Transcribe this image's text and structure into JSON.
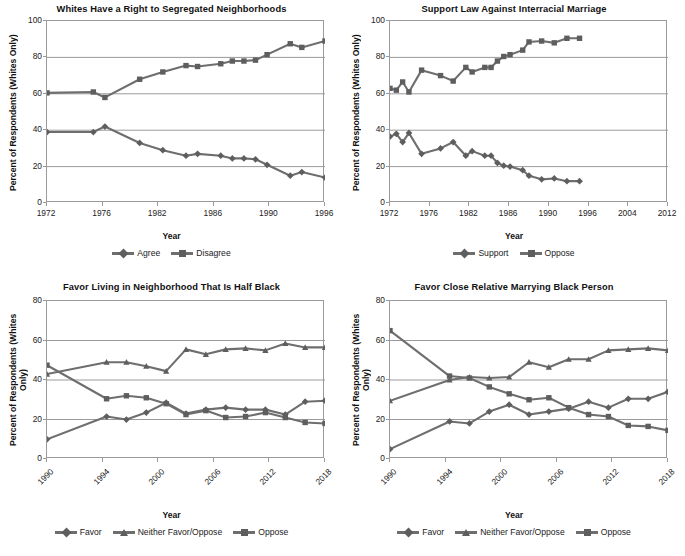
{
  "figure": {
    "background": "#ffffff",
    "series_color": "#6e6e6e",
    "marker_color": "#5e5e5e",
    "grid_color": "#9a9a9a",
    "axis_color": "#9a9a9a"
  },
  "panels": [
    {
      "key": "segregated-neighborhoods",
      "title": "Whites Have a Right to Segregated Neighborhoods",
      "ylabel": "Percent of Respondents (Whites Only)",
      "xlabel": "Year",
      "legend": [
        {
          "label": "Agree",
          "marker": "diamond"
        },
        {
          "label": "Disagree",
          "marker": "square"
        }
      ]
    },
    {
      "key": "interracial-marriage-law",
      "title": "Support Law Against Interracial Marriage",
      "ylabel": "Percent of Respondents (Whites Only)",
      "xlabel": "Year",
      "legend": [
        {
          "label": "Support",
          "marker": "diamond"
        },
        {
          "label": "Oppose",
          "marker": "square"
        }
      ]
    },
    {
      "key": "half-black-neighborhood",
      "title": "Favor Living in Neighborhood That Is Half Black",
      "ylabel": "Percent of Respondents (Whites Only)",
      "xlabel": "Year",
      "legend": [
        {
          "label": "Favor",
          "marker": "diamond"
        },
        {
          "label": "Neither Favor/Oppose",
          "marker": "triangle"
        },
        {
          "label": "Oppose",
          "marker": "square"
        }
      ]
    },
    {
      "key": "close-relative-marrying",
      "title": "Favor Close Relative Marrying Black Person",
      "ylabel": "Percent of Respondents (Whites Only)",
      "xlabel": "Year",
      "legend": [
        {
          "label": "Favor",
          "marker": "diamond"
        },
        {
          "label": "Neither Favor/Oppose",
          "marker": "triangle"
        },
        {
          "label": "Oppose",
          "marker": "square"
        }
      ]
    }
  ],
  "chart_data": [
    {
      "type": "line",
      "title": "Whites Have a Right to Segregated Neighborhoods",
      "xlabel": "Year",
      "ylabel": "Percent of Respondents (Whites Only)",
      "xlim": [
        1972,
        1996
      ],
      "ylim": [
        0,
        100
      ],
      "yticks": [
        0,
        20,
        40,
        60,
        80,
        100
      ],
      "xticks": [
        1972,
        1976,
        1982,
        1986,
        1990,
        1996
      ],
      "grid": "horizontal",
      "legend_position": "bottom",
      "series": [
        {
          "name": "Agree",
          "marker": "diamond",
          "x": [
            1972,
            1976,
            1977,
            1980,
            1982,
            1984,
            1985,
            1987,
            1988,
            1989,
            1990,
            1991,
            1993,
            1994,
            1996
          ],
          "values": [
            39,
            39,
            42,
            33,
            29,
            26,
            27,
            26,
            24.5,
            24.5,
            24,
            21,
            15,
            17,
            14
          ]
        },
        {
          "name": "Disagree",
          "marker": "square",
          "x": [
            1972,
            1976,
            1977,
            1980,
            1982,
            1984,
            1985,
            1987,
            1988,
            1989,
            1990,
            1991,
            1993,
            1994,
            1996
          ],
          "values": [
            60.5,
            61,
            58,
            68,
            72,
            75.5,
            75,
            76.5,
            78,
            78,
            78.5,
            81.5,
            87.5,
            85.5,
            89
          ]
        }
      ]
    },
    {
      "type": "line",
      "title": "Support Law Against Interracial Marriage",
      "xlabel": "Year",
      "ylabel": "Percent of Respondents (Whites Only)",
      "xlim": [
        1972,
        2016
      ],
      "ylim": [
        0,
        100
      ],
      "yticks": [
        0,
        20,
        40,
        60,
        80,
        100
      ],
      "xticks": [
        1972,
        1976,
        1982,
        1986,
        1990,
        1996,
        2004,
        2012
      ],
      "grid": "horizontal",
      "legend_position": "bottom",
      "series": [
        {
          "name": "Support",
          "marker": "diamond",
          "x": [
            1972,
            1973,
            1974,
            1975,
            1977,
            1980,
            1982,
            1984,
            1985,
            1987,
            1988,
            1989,
            1990,
            1991,
            1993,
            1994,
            1996,
            1998,
            2000,
            2002
          ],
          "values": [
            36.5,
            38,
            33.5,
            38.5,
            27,
            30,
            33.5,
            26,
            28.5,
            26,
            26,
            22,
            20.5,
            20,
            18,
            15,
            13,
            13.5,
            12,
            12
          ]
        },
        {
          "name": "Oppose",
          "marker": "square",
          "x": [
            1972,
            1973,
            1974,
            1975,
            1977,
            1980,
            1982,
            1984,
            1985,
            1987,
            1988,
            1989,
            1990,
            1991,
            1993,
            1994,
            1996,
            1998,
            2000,
            2002
          ],
          "values": [
            63,
            62,
            66.5,
            61,
            73,
            70,
            67,
            74.5,
            72,
            74.5,
            74.5,
            78,
            80.5,
            81.5,
            84,
            88.5,
            89,
            88,
            90.5,
            90.5
          ]
        }
      ]
    },
    {
      "type": "line",
      "title": "Favor Living in Neighborhood That Is Half Black",
      "xlabel": "Year",
      "ylabel": "Percent of Respondents (Whites Only)",
      "xlim": [
        1990,
        2018
      ],
      "ylim": [
        0,
        80
      ],
      "yticks": [
        0,
        20,
        40,
        60,
        80
      ],
      "xticks": [
        1990,
        1994,
        2000,
        2006,
        2012,
        2018
      ],
      "grid": "horizontal",
      "legend_position": "bottom",
      "series": [
        {
          "name": "Favor",
          "marker": "diamond",
          "x": [
            1990,
            1996,
            1998,
            2000,
            2002,
            2004,
            2006,
            2008,
            2010,
            2012,
            2014,
            2016,
            2018
          ],
          "values": [
            10,
            21.5,
            20,
            23.5,
            28.5,
            23,
            25,
            26,
            25,
            25,
            22.5,
            29,
            29.5
          ]
        },
        {
          "name": "Neither Favor/Oppose",
          "marker": "triangle",
          "x": [
            1990,
            1996,
            1998,
            2000,
            2002,
            2004,
            2006,
            2008,
            2010,
            2012,
            2014,
            2016,
            2018
          ],
          "values": [
            43,
            49,
            49,
            47,
            44.5,
            55.5,
            53,
            55.5,
            56,
            55,
            58.5,
            56.5,
            56.5
          ]
        },
        {
          "name": "Oppose",
          "marker": "square",
          "x": [
            1990,
            1996,
            1998,
            2000,
            2002,
            2004,
            2006,
            2008,
            2010,
            2012,
            2014,
            2016,
            2018
          ],
          "values": [
            47.5,
            30.5,
            32,
            31,
            28,
            22.5,
            24.5,
            21,
            21.5,
            23.5,
            21,
            18.5,
            18
          ]
        }
      ]
    },
    {
      "type": "line",
      "title": "Favor Close Relative Marrying Black Person",
      "xlabel": "Year",
      "ylabel": "Percent of Respondents (Whites Only)",
      "xlim": [
        1990,
        2018
      ],
      "ylim": [
        0,
        80
      ],
      "yticks": [
        0,
        20,
        40,
        60,
        80
      ],
      "xticks": [
        1990,
        1994,
        2000,
        2006,
        2012,
        2018
      ],
      "grid": "horizontal",
      "legend_position": "bottom",
      "series": [
        {
          "name": "Favor",
          "marker": "diamond",
          "x": [
            1990,
            1996,
            1998,
            2000,
            2002,
            2004,
            2006,
            2008,
            2010,
            2012,
            2014,
            2016,
            2018
          ],
          "values": [
            5,
            19,
            18,
            24,
            27.5,
            22.5,
            24,
            25.5,
            29,
            26,
            30.5,
            30.5,
            34
          ]
        },
        {
          "name": "Neither Favor/Oppose",
          "marker": "triangle",
          "x": [
            1990,
            1996,
            1998,
            2000,
            2002,
            2004,
            2006,
            2008,
            2010,
            2012,
            2014,
            2016,
            2018
          ],
          "values": [
            29.5,
            40,
            41.5,
            41,
            41.5,
            49,
            46.5,
            50.5,
            50.5,
            55,
            55.5,
            56,
            55
          ]
        },
        {
          "name": "Oppose",
          "marker": "square",
          "x": [
            1990,
            1996,
            1998,
            2000,
            2002,
            2004,
            2006,
            2008,
            2010,
            2012,
            2014,
            2016,
            2018
          ],
          "values": [
            65,
            42,
            41,
            36.5,
            33,
            30,
            31,
            26,
            22.5,
            21.5,
            17,
            16.5,
            14.5
          ]
        }
      ]
    }
  ]
}
